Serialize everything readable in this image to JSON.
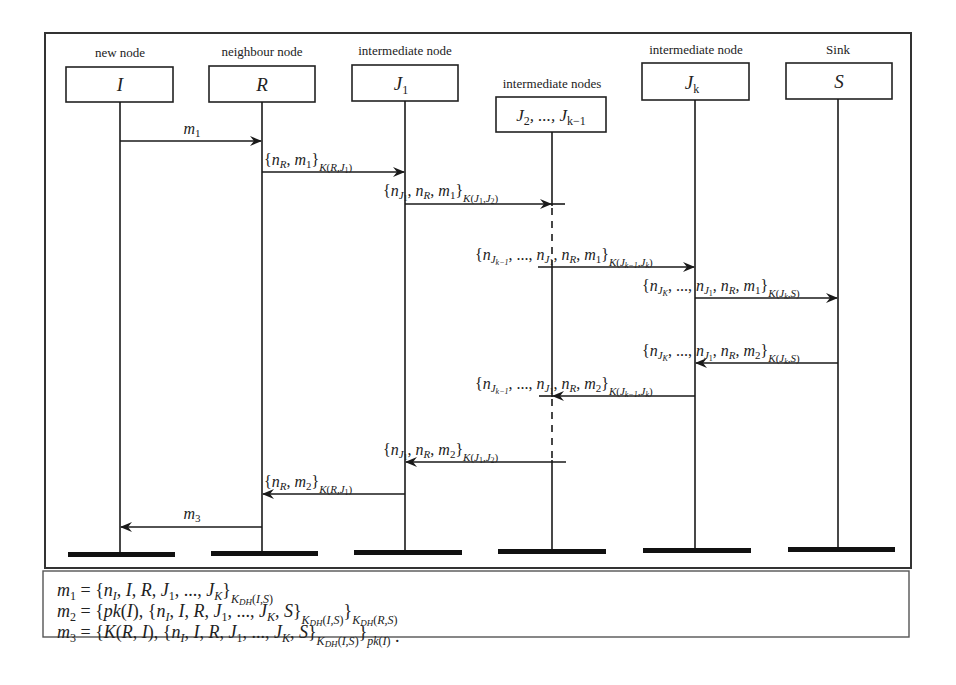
{
  "diagram": {
    "type": "sequence-diagram",
    "participants": [
      {
        "id": "I",
        "caption": "new node",
        "label": "I",
        "x": 120
      },
      {
        "id": "R",
        "caption": "neighbour node",
        "label": "R",
        "x": 262
      },
      {
        "id": "J1",
        "caption": "intermediate node",
        "label": "J",
        "label_sub": "1",
        "x": 405
      },
      {
        "id": "J2..Jk-1",
        "caption": "intermediate nodes",
        "label": "J",
        "label_sub": "2",
        "label_rest": ", ..., J",
        "label_rest_sub": "k−1",
        "x": 552
      },
      {
        "id": "Jk",
        "caption": "intermediate node",
        "label": "J",
        "label_sub": "k",
        "x": 695
      },
      {
        "id": "S",
        "caption": "Sink",
        "label": "S",
        "x": 838
      }
    ],
    "messages": [
      {
        "from": "I",
        "to": "R",
        "label": "m₁",
        "y": 141
      },
      {
        "from": "R",
        "to": "J1",
        "label": "{n_R, m₁}_K(R,J₁)",
        "y": 172
      },
      {
        "from": "J1",
        "to": "J2..Jk-1",
        "label": "{n_J₁, n_R, m₁}_K(J₁,J₂)",
        "y": 204
      },
      {
        "from": "J2..Jk-1",
        "to": "Jk",
        "label": "{n_J(k−1), ..., n_J₁, n_R, m₁}_K(J(k−1),J_k)",
        "y": 267
      },
      {
        "from": "Jk",
        "to": "S",
        "label": "{n_J_K, ..., n_J₁, n_R, m₁}_K(J_k,S)",
        "y": 298
      },
      {
        "from": "S",
        "to": "Jk",
        "label": "{n_J_K, ..., n_J₁, n_R, m₂}_K(J_k,S)",
        "y": 363
      },
      {
        "from": "Jk",
        "to": "J2..Jk-1",
        "label": "{n_J(k−1), ..., n_J₁, n_R, m₂}_K(J(k−1),J_k)",
        "y": 396
      },
      {
        "from": "J2..Jk-1",
        "to": "J1",
        "label": "{n_J₁, n_R, m₂}_K(J₁,J₂)",
        "y": 462
      },
      {
        "from": "J1",
        "to": "R",
        "label": "{n_R, m₂}_K(R,J₁)",
        "y": 494
      },
      {
        "from": "R",
        "to": "I",
        "label": "m₃",
        "y": 527
      }
    ],
    "legend": [
      "m₁ = {n_I, I, R, J₁, ..., J_K}_K_DH(I,S)",
      "m₂ = {pk(I), {n_I, I, R, J₁, ..., J_K, S}_K_DH(I,S)}_K_DH(R,S)",
      "m₃ = {K(R,I), {n_I, I, R, J₁, ..., J_K, S}_K_DH(I,S)}_pk(I) ."
    ],
    "colors": {
      "line": "#1a1a1a",
      "frame": "#333333",
      "background": "#ffffff"
    }
  }
}
